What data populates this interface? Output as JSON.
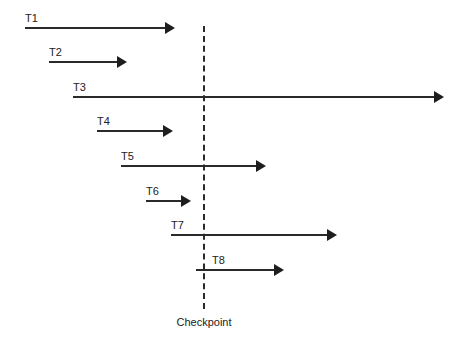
{
  "diagram": {
    "type": "transaction-timeline",
    "checkpoint": {
      "label": "Checkpoint",
      "x": 204,
      "y_top": 26,
      "y_bottom": 309
    },
    "transactions": [
      {
        "label": "T1",
        "start_x": 25,
        "end_x": 175,
        "y": 28
      },
      {
        "label": "T2",
        "start_x": 49,
        "end_x": 127,
        "y": 62
      },
      {
        "label": "T3",
        "start_x": 73,
        "end_x": 444,
        "y": 97
      },
      {
        "label": "T4",
        "start_x": 97,
        "end_x": 173,
        "y": 131
      },
      {
        "label": "T5",
        "start_x": 121,
        "end_x": 266,
        "y": 166
      },
      {
        "label": "T6",
        "start_x": 146,
        "end_x": 191,
        "y": 201
      },
      {
        "label": "T7",
        "start_x": 171,
        "end_x": 337,
        "y": 235
      },
      {
        "label": "T8",
        "start_x": 196,
        "end_x": 284,
        "y": 270,
        "label_x": 212
      }
    ]
  }
}
